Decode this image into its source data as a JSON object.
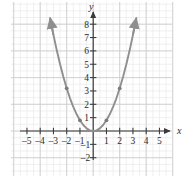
{
  "figure": {
    "kind": "coordinate-plane-graph",
    "background_color": "#ffffff",
    "width_px": 186,
    "height_px": 176
  },
  "axes": {
    "x_axis_label": "x",
    "y_axis_label": "y",
    "axis_color": "#3a3a3a",
    "x_tick_labels": [
      "–5",
      "–4",
      "–3",
      "–2",
      "–1",
      "1",
      "2",
      "3",
      "4",
      "5"
    ],
    "y_tick_labels": [
      "8",
      "7",
      "6",
      "5",
      "4",
      "3",
      "2",
      "1",
      "–1",
      "–2"
    ]
  },
  "grid": {
    "minor_color": "#e9e9e9",
    "major_color": "#cfcfcf",
    "visible": true
  },
  "chart_data": {
    "type": "line",
    "title": "",
    "subtitle": "",
    "xlabel": "x",
    "ylabel": "y",
    "xlim": [
      -5.8,
      5.8
    ],
    "ylim": [
      -2.8,
      8.8
    ],
    "grid": true,
    "legend": null,
    "x_ticks": [
      -5,
      -4,
      -3,
      -2,
      -1,
      1,
      2,
      3,
      4,
      5
    ],
    "y_ticks": [
      8,
      7,
      6,
      5,
      4,
      3,
      2,
      1,
      -1,
      -2
    ],
    "curve_color": "#8f8f8f",
    "series": [
      {
        "name": "parabola",
        "equation": "y = 0.8x²",
        "vertex": [
          0,
          0
        ],
        "opens": "up",
        "arrow_ends": [
          "up-left",
          "up-right"
        ],
        "x": [
          -3.25,
          -3.0,
          -2.75,
          -2.5,
          -2.25,
          -2.0,
          -1.75,
          -1.5,
          -1.25,
          -1.0,
          -0.75,
          -0.5,
          -0.25,
          0,
          0.25,
          0.5,
          0.75,
          1.0,
          1.25,
          1.5,
          1.75,
          2.0,
          2.25,
          2.5,
          2.75,
          3.0,
          3.25
        ],
        "y": [
          8.45,
          7.2,
          6.05,
          5.0,
          4.05,
          3.2,
          2.45,
          1.8,
          1.25,
          0.8,
          0.45,
          0.2,
          0.05,
          0,
          0.05,
          0.2,
          0.45,
          0.8,
          1.25,
          1.8,
          2.45,
          3.2,
          4.05,
          5.0,
          6.05,
          7.2,
          8.45
        ]
      }
    ],
    "marked_points": [
      {
        "x": -2,
        "y": 3.2
      },
      {
        "x": -1,
        "y": 0.8
      },
      {
        "x": 1,
        "y": 0.8
      },
      {
        "x": 2,
        "y": 3.2
      }
    ]
  }
}
